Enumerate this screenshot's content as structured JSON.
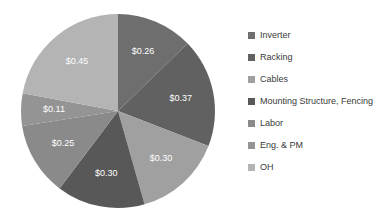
{
  "chart_data": {
    "type": "pie",
    "title": "",
    "categories": [
      "Inverter",
      "Racking",
      "Cables",
      "Mounting Structure,  Fencing",
      "Labor",
      "Eng. & PM",
      "OH"
    ],
    "values": [
      0.26,
      0.37,
      0.3,
      0.3,
      0.25,
      0.11,
      0.45
    ],
    "value_labels": [
      "$0.26",
      "$0.37",
      "$0.30",
      "$0.30",
      "$0.25",
      "$0.11",
      "$0.45"
    ],
    "colors": [
      "#6e6e6e",
      "#616161",
      "#a0a0a0",
      "#585858",
      "#8a8a8a",
      "#949494",
      "#b4b4b4"
    ],
    "total": 2.04,
    "start_angle": 0,
    "direction": "clockwise",
    "legend_position": "right",
    "grid": false,
    "xlabel": "",
    "ylabel": ""
  },
  "legend": {
    "items": [
      {
        "label": "Inverter",
        "color": "#6e6e6e",
        "value_label": "$0.26"
      },
      {
        "label": "Racking",
        "color": "#616161",
        "value_label": "$0.37"
      },
      {
        "label": "Cables",
        "color": "#a0a0a0",
        "value_label": "$0.30"
      },
      {
        "label": "Mounting Structure,  Fencing",
        "color": "#585858",
        "value_label": "$0.30"
      },
      {
        "label": "Labor",
        "color": "#8a8a8a",
        "value_label": "$0.25"
      },
      {
        "label": "Eng. & PM",
        "color": "#949494",
        "value_label": "$0.11"
      },
      {
        "label": "OH",
        "color": "#b4b4b4",
        "value_label": "$0.45"
      }
    ]
  }
}
